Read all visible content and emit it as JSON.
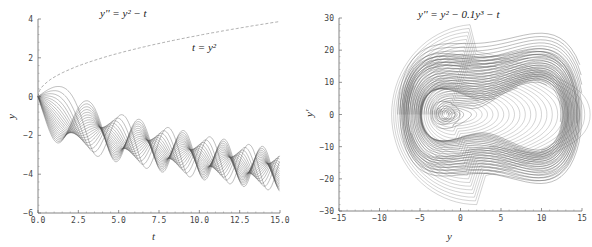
{
  "chart_data": [
    {
      "type": "line",
      "title": "y'' = y² − t",
      "annotation": "t = y²",
      "xlabel": "t",
      "ylabel": "y",
      "xlim": [
        0,
        15
      ],
      "ylim": [
        -6,
        4
      ],
      "xticks": [
        "0.0",
        "2.5",
        "5.0",
        "7.5",
        "10.0",
        "12.5",
        "15.0"
      ],
      "yticks": [
        "−6",
        "−4",
        "−2",
        "0",
        "2",
        "4"
      ],
      "grid": false,
      "series": [
        {
          "name": "family of solutions y(0)=0, y'(0) varying",
          "style": "solid",
          "count": 20
        },
        {
          "name": "t = y² (upper branch y = √t)",
          "style": "dashed"
        }
      ]
    },
    {
      "type": "line",
      "title": "y'' = y² − 0.1y³ − t",
      "xlabel": "y",
      "ylabel": "y'",
      "xlim": [
        -15,
        15
      ],
      "ylim": [
        -30,
        30
      ],
      "xticks": [
        "−15",
        "−10",
        "−5",
        "0",
        "5",
        "10",
        "15"
      ],
      "yticks": [
        "−30",
        "−20",
        "−10",
        "0",
        "10",
        "20",
        "30"
      ],
      "grid": false,
      "series": [
        {
          "name": "phase portrait trajectories",
          "style": "solid"
        }
      ]
    }
  ]
}
